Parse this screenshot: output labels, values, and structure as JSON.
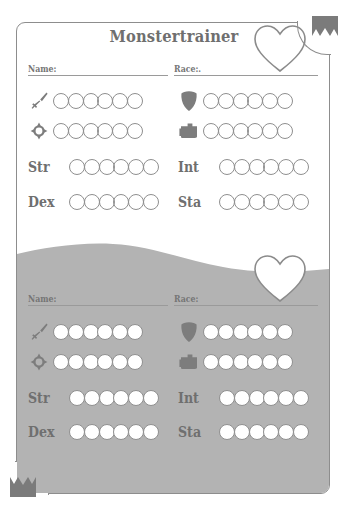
{
  "sheet": {
    "title": "Monstertrainer",
    "colors": {
      "ink": "#7b7b7b",
      "line": "#8f8f8f",
      "overlay_grey": "#b3b3b3",
      "paper": "#ffffff"
    }
  },
  "decorations": {
    "banner_top_right": "banner-icon",
    "banner_bottom_left": "banner-icon",
    "heart_top": "heart-icon",
    "heart_bottom": "heart-icon"
  },
  "panels": [
    {
      "id": "top",
      "shaded": false,
      "fields": [
        {
          "label": "Name:",
          "value": "",
          "name": "name-field"
        },
        {
          "label": "Race:.",
          "value": "",
          "name": "race-field"
        }
      ],
      "stats": [
        {
          "icon": "sword-icon",
          "label": "",
          "pips": 6,
          "filled": 0,
          "column": "left"
        },
        {
          "icon": "shield-icon",
          "label": "",
          "pips": 6,
          "filled": 0,
          "column": "right"
        },
        {
          "icon": "crosshair-icon",
          "label": "",
          "pips": 6,
          "filled": 0,
          "column": "left"
        },
        {
          "icon": "book-icon",
          "label": "",
          "pips": 6,
          "filled": 0,
          "column": "right"
        },
        {
          "icon": "",
          "label": "Str",
          "pips": 6,
          "filled": 0,
          "column": "left"
        },
        {
          "icon": "",
          "label": "Int",
          "pips": 6,
          "filled": 0,
          "column": "right"
        },
        {
          "icon": "",
          "label": "Dex",
          "pips": 6,
          "filled": 0,
          "column": "left"
        },
        {
          "icon": "",
          "label": "Sta",
          "pips": 6,
          "filled": 0,
          "column": "right"
        }
      ]
    },
    {
      "id": "bottom",
      "shaded": true,
      "fields": [
        {
          "label": "Name:",
          "value": "",
          "name": "name-field"
        },
        {
          "label": "Race:",
          "value": "",
          "name": "race-field"
        }
      ],
      "stats": [
        {
          "icon": "sword-icon",
          "label": "",
          "pips": 6,
          "filled": 6,
          "column": "left"
        },
        {
          "icon": "shield-icon",
          "label": "",
          "pips": 6,
          "filled": 6,
          "column": "right"
        },
        {
          "icon": "crosshair-icon",
          "label": "",
          "pips": 6,
          "filled": 6,
          "column": "left"
        },
        {
          "icon": "book-icon",
          "label": "",
          "pips": 6,
          "filled": 6,
          "column": "right"
        },
        {
          "icon": "",
          "label": "Str",
          "pips": 6,
          "filled": 6,
          "column": "left"
        },
        {
          "icon": "",
          "label": "Int",
          "pips": 6,
          "filled": 6,
          "column": "right"
        },
        {
          "icon": "",
          "label": "Dex",
          "pips": 6,
          "filled": 6,
          "column": "left"
        },
        {
          "icon": "",
          "label": "Sta",
          "pips": 6,
          "filled": 6,
          "column": "right"
        }
      ]
    }
  ]
}
